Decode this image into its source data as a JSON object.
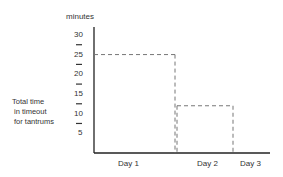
{
  "chart_data": {
    "type": "line",
    "subtype": "step",
    "title": "",
    "ylabel_unit": "minutes",
    "ylabel_lines": [
      "Total time",
      "in timeout",
      "for tantrums"
    ],
    "xlabel": "",
    "categories": [
      "Day 1",
      "Day 2",
      "Day 3"
    ],
    "values": [
      25,
      12,
      0
    ],
    "yticks": [
      5,
      10,
      15,
      20,
      25,
      30
    ],
    "ylim": [
      0,
      32
    ],
    "grid": false,
    "line_style": "dashed",
    "legend": "none"
  }
}
